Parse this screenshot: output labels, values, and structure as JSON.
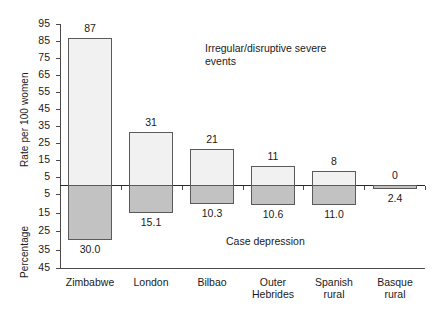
{
  "chart_data": {
    "type": "bar",
    "title": "",
    "subtitle": "",
    "categories": [
      "Zimbabwe",
      "London",
      "Bilbao",
      "Outer Hebrides",
      "Spanish rural",
      "Basque rural"
    ],
    "category_lines": [
      [
        "Zimbabwe"
      ],
      [
        "London"
      ],
      [
        "Bilbao"
      ],
      [
        "Outer",
        "Hebrides"
      ],
      [
        "Spanish",
        "rural"
      ],
      [
        "Basque",
        "rural"
      ]
    ],
    "series": [
      {
        "name": "Irregular/disruptive severe events",
        "direction": "up",
        "axis": "Rate per 100 women",
        "values": [
          87,
          31,
          21,
          11,
          8,
          0
        ],
        "value_labels": [
          "87",
          "31",
          "21",
          "11",
          "8",
          "0"
        ],
        "color": "#f1f1f1"
      },
      {
        "name": "Case depression",
        "direction": "down",
        "axis": "Percentage",
        "values": [
          30.0,
          15.1,
          10.3,
          10.6,
          11.0,
          2.4
        ],
        "value_labels": [
          "30.0",
          "15.1",
          "10.3",
          "10.6",
          "11.0",
          "2.4"
        ],
        "color": "#c2c2c2"
      }
    ],
    "ylabel_top": "Rate per 100 women",
    "ylabel_bottom": "Percentage",
    "xlabel": "",
    "yticks_top": [
      5,
      15,
      25,
      35,
      45,
      55,
      65,
      75,
      85,
      95
    ],
    "yticks_bottom": [
      5,
      15,
      25,
      35,
      45
    ],
    "ylim_top": [
      0,
      95
    ],
    "ylim_bottom": [
      0,
      45
    ],
    "grid": false,
    "legend": "none",
    "annotations": [
      {
        "id": "events-annotation",
        "text": "Irregular/disruptive severe\nevents"
      },
      {
        "id": "depression-annotation",
        "text": "Case depression"
      }
    ]
  },
  "colors": {
    "bar_rate": "#f1f1f1",
    "bar_depression": "#c2c2c2",
    "bar_border": "#5a5a5a",
    "axis": "#4a4a4a",
    "text": "#1a1a1a",
    "background": "#ffffff"
  }
}
